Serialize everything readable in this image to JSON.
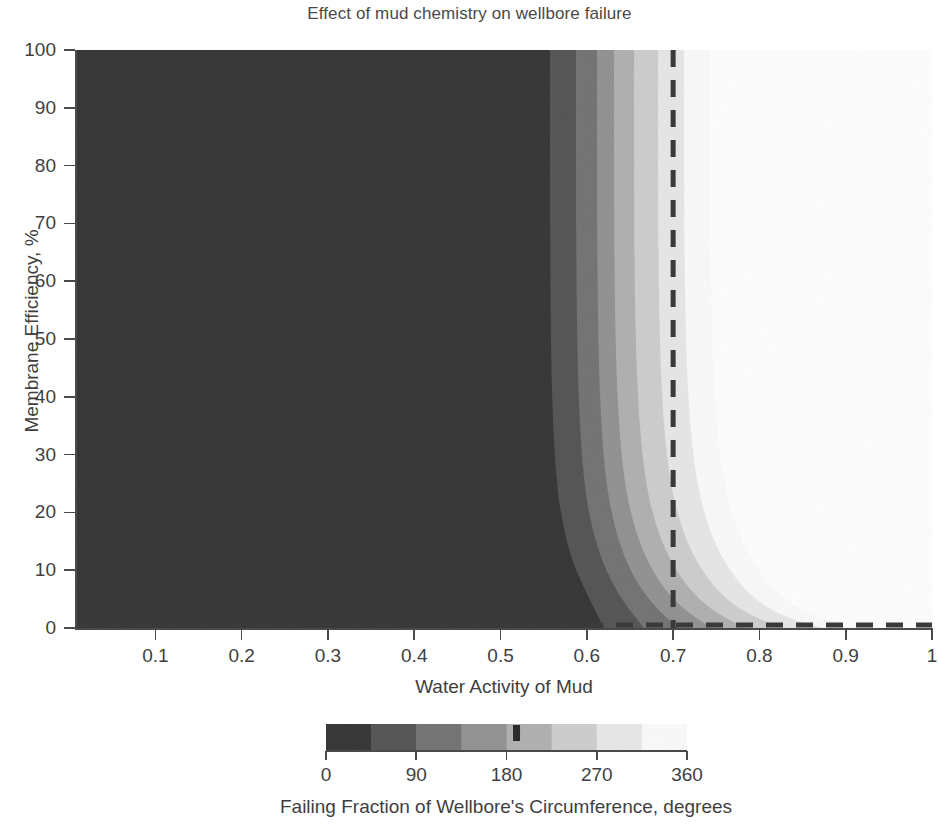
{
  "chart_data": {
    "type": "heatmap",
    "title": "Effect of mud chemistry on wellbore failure",
    "xlabel": "Water Activity of Mud",
    "ylabel": "Membrane Efficiency, %",
    "xlim": [
      0.008,
      1.0
    ],
    "ylim": [
      0,
      100
    ],
    "grid": false,
    "legend": "none",
    "xticks": [
      0.1,
      0.2,
      0.3,
      0.4,
      0.5,
      0.6,
      0.7,
      0.8,
      0.9,
      1.0
    ],
    "xtick_labels": [
      "0.1",
      "0.2",
      "0.3",
      "0.4",
      "0.5",
      "0.6",
      "0.7",
      "0.8",
      "0.9",
      "1"
    ],
    "yticks": [
      0,
      10,
      20,
      30,
      40,
      50,
      60,
      70,
      80,
      90,
      100
    ],
    "ytick_labels": [
      "0",
      "10",
      "20",
      "30",
      "40",
      "50",
      "60",
      "70",
      "80",
      "90",
      "100"
    ],
    "colorbar": {
      "label": "Failing Fraction of Wellbore's Circumference, degrees",
      "ticks": [
        0,
        90,
        180,
        270,
        360
      ],
      "tick_labels": [
        "0",
        "90",
        "180",
        "270",
        "360"
      ],
      "range": [
        0,
        360
      ],
      "colormap": "grayscale-discrete",
      "band_step_degrees": 45,
      "bands": [
        {
          "from": 0,
          "to": 45,
          "color": "#3a3a3a"
        },
        {
          "from": 45,
          "to": 90,
          "color": "#585858"
        },
        {
          "from": 90,
          "to": 135,
          "color": "#767676"
        },
        {
          "from": 135,
          "to": 180,
          "color": "#949494"
        },
        {
          "from": 180,
          "to": 225,
          "color": "#b2b2b2"
        },
        {
          "from": 225,
          "to": 270,
          "color": "#cfcfcf"
        },
        {
          "from": 270,
          "to": 315,
          "color": "#e8e8e8"
        },
        {
          "from": 315,
          "to": 360,
          "color": "#fbfbfb"
        }
      ],
      "marker_value": 190,
      "marker_color": "#2b2b2b"
    },
    "annotations": [
      {
        "name": "vertical-dashed-line",
        "type": "vline",
        "x": 0.7,
        "style": "dashed",
        "color": "#3a3a3a"
      },
      {
        "name": "horizontal-dashed-line",
        "type": "hline",
        "y": 0.0,
        "style": "dashed",
        "color": "#3a3a3a"
      }
    ],
    "contour_levels_degrees": [
      45,
      90,
      135,
      180,
      225,
      270,
      315,
      360
    ],
    "contour_x_at_high_efficiency": [
      0.624,
      0.655,
      0.68,
      0.7,
      0.72,
      0.742,
      0.772,
      0.815
    ],
    "contour_x_at_zero_efficiency": [
      0.725,
      0.76,
      0.8,
      0.84,
      0.88,
      0.92,
      0.96,
      0.995
    ]
  },
  "colors": {
    "axis": "#4a4a4a",
    "text": "#3f3f3f",
    "background": "#ffffff"
  }
}
